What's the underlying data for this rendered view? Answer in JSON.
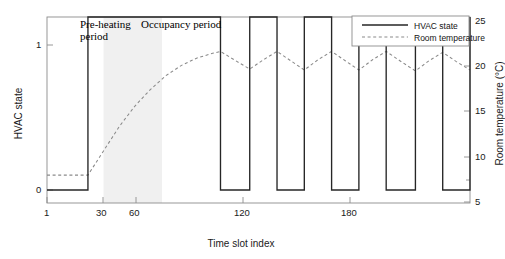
{
  "chart_data": {
    "type": "line",
    "title": "",
    "xlabel": "Time slot index",
    "ylabel": "HVAC state",
    "y2label": "Room temperature (°C)",
    "xlim": [
      1,
      218
    ],
    "ylim": [
      0,
      1
    ],
    "y2lim": [
      5,
      25
    ],
    "xticks": [
      1,
      30,
      60,
      120,
      180
    ],
    "xticklabels": [
      "1",
      "30",
      "60",
      "120",
      "180"
    ],
    "yticks": [
      0,
      1
    ],
    "yticklabels": [
      "0",
      "1"
    ],
    "y2ticks": [
      5,
      10,
      15,
      20,
      25
    ],
    "y2ticklabels": [
      "5",
      "10",
      "15",
      "20",
      "25"
    ],
    "grid": false,
    "legend_position": "top-right",
    "series": [
      {
        "name": "HVAC state",
        "axis": "left",
        "style": "solid",
        "color": "#262626",
        "points": [
          [
            1,
            0
          ],
          [
            22,
            0
          ],
          [
            22,
            1
          ],
          [
            90,
            1
          ],
          [
            90,
            0
          ],
          [
            105,
            0
          ],
          [
            105,
            1
          ],
          [
            119,
            1
          ],
          [
            119,
            0
          ],
          [
            133,
            0
          ],
          [
            133,
            1
          ],
          [
            147,
            1
          ],
          [
            147,
            0
          ],
          [
            161,
            0
          ],
          [
            161,
            1
          ],
          [
            175,
            1
          ],
          [
            175,
            0
          ],
          [
            190,
            0
          ],
          [
            190,
            1
          ],
          [
            204,
            1
          ],
          [
            204,
            0
          ],
          [
            218,
            0
          ],
          [
            218,
            1
          ]
        ]
      },
      {
        "name": "Room temperature",
        "axis": "right",
        "style": "dashed",
        "color": "#8a8a8a",
        "points": [
          [
            1,
            8.0
          ],
          [
            10,
            8.0
          ],
          [
            22,
            8.0
          ],
          [
            30,
            10.6
          ],
          [
            38,
            13.2
          ],
          [
            46,
            15.4
          ],
          [
            54,
            17.2
          ],
          [
            62,
            18.7
          ],
          [
            70,
            19.8
          ],
          [
            78,
            20.6
          ],
          [
            86,
            21.1
          ],
          [
            90,
            21.3
          ],
          [
            97,
            20.4
          ],
          [
            105,
            19.4
          ],
          [
            112,
            20.4
          ],
          [
            119,
            21.3
          ],
          [
            126,
            20.3
          ],
          [
            133,
            19.3
          ],
          [
            140,
            20.4
          ],
          [
            147,
            21.3
          ],
          [
            154,
            20.3
          ],
          [
            161,
            19.3
          ],
          [
            168,
            20.4
          ],
          [
            175,
            21.3
          ],
          [
            182,
            20.3
          ],
          [
            190,
            19.2
          ],
          [
            197,
            20.3
          ],
          [
            204,
            21.2
          ],
          [
            211,
            20.2
          ],
          [
            218,
            19.3
          ]
        ]
      }
    ],
    "annotations": [
      {
        "name": "pre-heating",
        "text": "Pre-heating period",
        "x_start": 30,
        "x_end": 60
      },
      {
        "name": "occupancy",
        "text": "Occupancy period",
        "x_start": 60,
        "x_end": 218
      }
    ],
    "shaded_region": {
      "label": "Pre-heating period",
      "x_start": 30,
      "x_end": 60,
      "color": "#f0f0f0"
    }
  },
  "labels": {
    "xlabel": "Time slot index",
    "ylabel_left": "HVAC state",
    "ylabel_right": "Room temperature (°C)",
    "annot_preheat": "Pre-heating period",
    "annot_occupancy": "Occupancy period"
  },
  "legend": {
    "items": [
      {
        "label": "HVAC state",
        "style": "solid"
      },
      {
        "label": "Room temperature",
        "style": "dashed"
      }
    ]
  },
  "ticks": {
    "x": [
      "1",
      "30",
      "60",
      "120",
      "180"
    ],
    "y_left": [
      "1",
      "0"
    ],
    "y_right": [
      "25",
      "20",
      "15",
      "10",
      "5"
    ]
  },
  "colors": {
    "hvac_line": "#262626",
    "temp_line": "#8a8a8a",
    "shade": "#f0f0f0",
    "axis": "#8c8c8c",
    "text": "#1a1a1a"
  }
}
